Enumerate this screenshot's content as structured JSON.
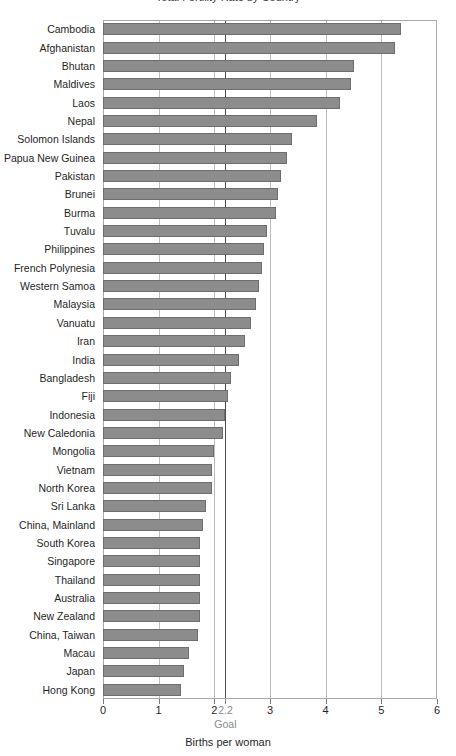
{
  "title_sliver": "Total Fertility Rate by Country",
  "chart_data": {
    "type": "bar",
    "orientation": "horizontal",
    "title": "Total Fertility Rate by Country",
    "xlabel": "Births per woman",
    "ylabel": "",
    "xlim": [
      0,
      6
    ],
    "xticks": [
      0,
      1,
      2,
      3,
      4,
      5,
      6
    ],
    "xtick_labels": [
      "0",
      "1",
      "2",
      "3",
      "4",
      "5",
      "6"
    ],
    "grid": true,
    "legend": "none",
    "bar_color": "#8c8c8c",
    "bar_edge_color": "#6e6e6e",
    "goal": {
      "value": 2.2,
      "value_label": "2.2",
      "caption": "Goal",
      "line_color": "#4d4d4d",
      "text_color": "#8a8a8a"
    },
    "categories": [
      "Cambodia",
      "Afghanistan",
      "Bhutan",
      "Maldives",
      "Laos",
      "Nepal",
      "Solomon Islands",
      "Papua New Guinea",
      "Pakistan",
      "Brunei",
      "Burma",
      "Tuvalu",
      "Philippines",
      "French Polynesia",
      "Western Samoa",
      "Malaysia",
      "Vanuatu",
      "Iran",
      "India",
      "Bangladesh",
      "Fiji",
      "Indonesia",
      "New Caledonia",
      "Mongolia",
      "Vietnam",
      "North Korea",
      "Sri Lanka",
      "China, Mainland",
      "South Korea",
      "Singapore",
      "Thailand",
      "Australia",
      "New Zealand",
      "China, Taiwan",
      "Macau",
      "Japan",
      "Hong Kong"
    ],
    "values": [
      5.35,
      5.25,
      4.5,
      4.45,
      4.25,
      3.85,
      3.4,
      3.3,
      3.2,
      3.15,
      3.1,
      2.95,
      2.9,
      2.85,
      2.8,
      2.75,
      2.65,
      2.55,
      2.45,
      2.3,
      2.25,
      2.2,
      2.15,
      2.0,
      1.95,
      1.95,
      1.85,
      1.8,
      1.75,
      1.75,
      1.75,
      1.75,
      1.75,
      1.7,
      1.55,
      1.45,
      1.4
    ]
  }
}
